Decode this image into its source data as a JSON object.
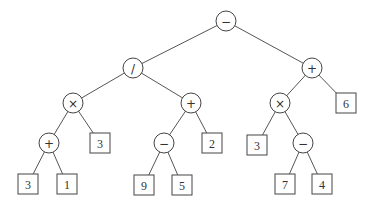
{
  "diagram": {
    "type": "expression-tree",
    "colors": {
      "stroke": "#444444",
      "edge": "#555555",
      "text": "#333333",
      "background": "#ffffff"
    },
    "nodes": [
      {
        "id": "n0",
        "kind": "op",
        "label": "−",
        "x": 226,
        "y": 21
      },
      {
        "id": "n1",
        "kind": "op",
        "label": "/",
        "x": 133,
        "y": 68
      },
      {
        "id": "n2",
        "kind": "op",
        "label": "+",
        "x": 312,
        "y": 68
      },
      {
        "id": "n3",
        "kind": "op",
        "label": "×",
        "x": 73,
        "y": 103
      },
      {
        "id": "n4",
        "kind": "op",
        "label": "+",
        "x": 191,
        "y": 103
      },
      {
        "id": "n5",
        "kind": "op",
        "label": "×",
        "x": 280,
        "y": 103
      },
      {
        "id": "n6",
        "kind": "leaf",
        "label": "6",
        "x": 346,
        "y": 103
      },
      {
        "id": "n7",
        "kind": "op",
        "label": "+",
        "x": 49,
        "y": 143
      },
      {
        "id": "n8",
        "kind": "leaf",
        "label": "3",
        "x": 100,
        "y": 143
      },
      {
        "id": "n9",
        "kind": "op",
        "label": "−",
        "x": 164,
        "y": 143
      },
      {
        "id": "n10",
        "kind": "leaf",
        "label": "2",
        "x": 212,
        "y": 143
      },
      {
        "id": "n11",
        "kind": "leaf",
        "label": "3",
        "x": 257,
        "y": 145
      },
      {
        "id": "n12",
        "kind": "op",
        "label": "−",
        "x": 303,
        "y": 143
      },
      {
        "id": "n13",
        "kind": "leaf",
        "label": "3",
        "x": 28,
        "y": 184
      },
      {
        "id": "n14",
        "kind": "leaf",
        "label": "1",
        "x": 67,
        "y": 184
      },
      {
        "id": "n15",
        "kind": "leaf",
        "label": "9",
        "x": 144,
        "y": 185
      },
      {
        "id": "n16",
        "kind": "leaf",
        "label": "5",
        "x": 182,
        "y": 185
      },
      {
        "id": "n17",
        "kind": "leaf",
        "label": "7",
        "x": 285,
        "y": 184
      },
      {
        "id": "n18",
        "kind": "leaf",
        "label": "4",
        "x": 322,
        "y": 184
      }
    ],
    "edges": [
      [
        "n0",
        "n1"
      ],
      [
        "n0",
        "n2"
      ],
      [
        "n1",
        "n3"
      ],
      [
        "n1",
        "n4"
      ],
      [
        "n2",
        "n5"
      ],
      [
        "n2",
        "n6"
      ],
      [
        "n3",
        "n7"
      ],
      [
        "n3",
        "n8"
      ],
      [
        "n4",
        "n9"
      ],
      [
        "n4",
        "n10"
      ],
      [
        "n5",
        "n11"
      ],
      [
        "n5",
        "n12"
      ],
      [
        "n7",
        "n13"
      ],
      [
        "n7",
        "n14"
      ],
      [
        "n9",
        "n15"
      ],
      [
        "n9",
        "n16"
      ],
      [
        "n12",
        "n17"
      ],
      [
        "n12",
        "n18"
      ]
    ],
    "expression": "((3 + 1) × 3) / ((9 − 5) + 2) − (3 × (7 − 4) + 6)"
  }
}
